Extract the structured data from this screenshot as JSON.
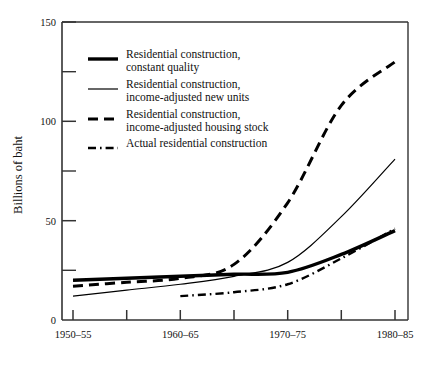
{
  "chart_data": {
    "type": "line",
    "title": "",
    "xlabel": "",
    "ylabel": "Billions of baht",
    "ylim": [
      0,
      150
    ],
    "yticks": [
      0,
      50,
      100,
      150
    ],
    "yticks_minor": [
      25,
      75,
      125
    ],
    "grid": false,
    "legend_position": "upper-left-inside",
    "categories": [
      "1950–55",
      "1955–60",
      "1960–65",
      "1965–70",
      "1970–75",
      "1975–80",
      "1980–85"
    ],
    "xtick_labels_shown": [
      "1950–55",
      "1960–65",
      "1970–75",
      "1980–85"
    ],
    "series": [
      {
        "name": "Residential construction, constant quality",
        "legend_label_line1": "Residential construction,",
        "legend_label_line2": "constant quality",
        "style": "thick-solid",
        "color": "#000000",
        "x": [
          "1950–55",
          "1955–60",
          "1960–65",
          "1965–70",
          "1970–75",
          "1975–80",
          "1980–85"
        ],
        "values": [
          20,
          21,
          22,
          23,
          24,
          33,
          45
        ]
      },
      {
        "name": "Residential construction, income-adjusted new units",
        "legend_label_line1": "Residential construction,",
        "legend_label_line2": "income-adjusted new units",
        "style": "thin-solid",
        "color": "#000000",
        "x": [
          "1950–55",
          "1955–60",
          "1960–65",
          "1965–70",
          "1970–75",
          "1975–80",
          "1980–85"
        ],
        "values": [
          12,
          15,
          18,
          22,
          29,
          52,
          81
        ]
      },
      {
        "name": "Residential construction, income-adjusted housing stock",
        "legend_label_line1": "Residential construction,",
        "legend_label_line2": "income-adjusted housing stock",
        "style": "dashed",
        "color": "#000000",
        "x": [
          "1950–55",
          "1955–60",
          "1960–65",
          "1965–70",
          "1970–75",
          "1975–80",
          "1980–85"
        ],
        "values": [
          17,
          19,
          21,
          28,
          59,
          108,
          130
        ]
      },
      {
        "name": "Actual residential construction",
        "legend_label_line1": "Actual residential construction",
        "legend_label_line2": "",
        "style": "dash-dot",
        "color": "#000000",
        "x": [
          "1960–65",
          "1965–70",
          "1970–75",
          "1975–80",
          "1980–85"
        ],
        "values": [
          12,
          14,
          18,
          31,
          46
        ]
      }
    ]
  },
  "axes": {
    "y_axis_title": "Billions of baht",
    "y_tick_150": "150",
    "y_tick_100": "100",
    "y_tick_50": "50",
    "y_tick_0": "0",
    "x_tick_1": "1950–55",
    "x_tick_2": "1960–65",
    "x_tick_3": "1970–75",
    "x_tick_4": "1980–85"
  },
  "legend": {
    "entry_1_line1": "Residential construction,",
    "entry_1_line2": "constant quality",
    "entry_2_line1": "Residential construction,",
    "entry_2_line2": "income-adjusted new units",
    "entry_3_line1": "Residential construction,",
    "entry_3_line2": "income-adjusted housing stock",
    "entry_4_line1": "Actual residential construction"
  }
}
